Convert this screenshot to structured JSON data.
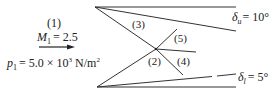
{
  "inflow": {
    "region": "(1)",
    "mach_symbol": "M",
    "mach_sub": "1",
    "mach_value": "= 2.5",
    "pressure_symbol": "p",
    "pressure_sub": "1",
    "pressure_value": "= 5.0 × 10",
    "pressure_exp": "3",
    "pressure_unit": " N/m",
    "pressure_unit_exp": "2"
  },
  "regions": {
    "r2": "(2)",
    "r3": "(3)",
    "r4": "(4)",
    "r5": "(5)"
  },
  "angles": {
    "upper_symbol": "δ",
    "upper_sub": "u",
    "upper_value": "= 10°",
    "lower_symbol": "δ",
    "lower_sub": "l",
    "lower_value": "= 5°"
  },
  "colors": {
    "line": "#333333",
    "text": "#222222"
  }
}
